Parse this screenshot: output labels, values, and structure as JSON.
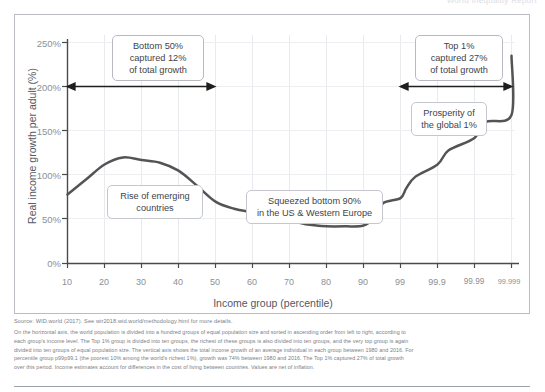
{
  "header": {
    "cut_text": "World Inequality Report"
  },
  "chart_data": {
    "type": "line",
    "title": "",
    "xlabel": "Income group (percentile)",
    "ylabel": "Real income growth per adult (%)",
    "xtick_labels": [
      "10",
      "20",
      "30",
      "40",
      "50",
      "60",
      "70",
      "80",
      "90",
      "99",
      "99.9",
      "99.99",
      "99.999"
    ],
    "ytick_labels": [
      "0%",
      "50%",
      "100%",
      "150%",
      "200%",
      "250%"
    ],
    "ylim": [
      0,
      250
    ],
    "grid": true,
    "legend": "none",
    "series": [
      {
        "name": "Real income growth per adult 1980-2016",
        "color": "#545454",
        "points": [
          {
            "x": "10",
            "y": 78
          },
          {
            "x": "15",
            "y": 95
          },
          {
            "x": "20",
            "y": 112
          },
          {
            "x": "25",
            "y": 120
          },
          {
            "x": "30",
            "y": 117
          },
          {
            "x": "35",
            "y": 114
          },
          {
            "x": "40",
            "y": 105
          },
          {
            "x": "45",
            "y": 88
          },
          {
            "x": "50",
            "y": 70
          },
          {
            "x": "55",
            "y": 62
          },
          {
            "x": "60",
            "y": 58
          },
          {
            "x": "65",
            "y": 54
          },
          {
            "x": "70",
            "y": 49
          },
          {
            "x": "75",
            "y": 44
          },
          {
            "x": "80",
            "y": 42
          },
          {
            "x": "85",
            "y": 42
          },
          {
            "x": "90",
            "y": 43
          },
          {
            "x": "95",
            "y": 52
          },
          {
            "x": "97",
            "y": 68
          },
          {
            "x": "99",
            "y": 74
          },
          {
            "x": "99.3",
            "y": 85
          },
          {
            "x": "99.6",
            "y": 98
          },
          {
            "x": "99.9",
            "y": 112
          },
          {
            "x": "99.95",
            "y": 128
          },
          {
            "x": "99.99",
            "y": 142
          },
          {
            "x": "99.995",
            "y": 160
          },
          {
            "x": "99.999",
            "y": 168
          },
          {
            "x": "99.9999",
            "y": 235
          }
        ]
      }
    ],
    "annotations": [
      {
        "name": "bottom-50-callout",
        "lines": [
          "Bottom 50%",
          "captured 12%",
          "of total growth"
        ]
      },
      {
        "name": "top-1-callout",
        "lines": [
          "Top 1%",
          "captured 27%",
          "of total growth"
        ]
      },
      {
        "name": "prosperity-callout",
        "lines": [
          "Prosperity of",
          "the global 1%"
        ]
      },
      {
        "name": "rise-emerging-callout",
        "lines": [
          "Rise of emerging",
          "countries"
        ]
      },
      {
        "name": "squeezed-callout",
        "lines": [
          "Squeezed bottom 90%",
          "in the US & Western Europe"
        ]
      }
    ],
    "range_arrows": [
      {
        "name": "bottom-50-range",
        "from": "10",
        "to": "50",
        "at_y": 200
      },
      {
        "name": "top-1-range",
        "from": "99",
        "to": "99.999",
        "at_y": 200
      }
    ]
  },
  "callouts": {
    "bottom50": {
      "l1": "Bottom 50%",
      "l2": "captured 12%",
      "l3": "of total growth"
    },
    "top1": {
      "l1": "Top 1%",
      "l2": "captured 27%",
      "l3": "of total growth"
    },
    "prosperity": {
      "l1": "Prosperity of",
      "l2": "the global 1%"
    },
    "emerging": {
      "l1": "Rise of emerging",
      "l2": "countries"
    },
    "squeezed": {
      "l1": "Squeezed bottom 90%",
      "l2": "in the US & Western Europe"
    }
  },
  "footer": {
    "source": "Source: WID.world (2017). See wir2018.wid.world/methodology.html for more details.",
    "note_lines": [
      "On the horizontal axis, the world population is divided into a hundred groups of equal population size and sorted in ascending order from left to right, according to",
      "each group's income level. The Top 1% group is divided into ten groups, the richest of these groups is also divided into ten groups, and the very top group is again",
      "divided into ten groups of equal population size. The vertical axis shows the total income growth of an average individual in each group between 1980 and 2016. For",
      "percentile group p99p99.1 (the poorest 10% among the world's richest 1%), growth was 74% between 1980 and 2016. The Top 1% captured 27% of total growth",
      "over this period. Income estimates account for differences in the cost of living between countries. Values are net of inflation."
    ]
  }
}
